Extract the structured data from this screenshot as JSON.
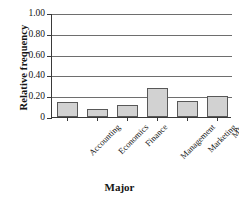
{
  "chart_data": {
    "type": "bar",
    "title": "",
    "xlabel": "Major",
    "ylabel": "Relative frequency",
    "categories": [
      "Accounting",
      "Economics",
      "Finance",
      "Management",
      "Marketing",
      "MIS"
    ],
    "values": [
      0.14,
      0.08,
      0.12,
      0.28,
      0.15,
      0.2
    ],
    "ylim": [
      0.0,
      1.0
    ],
    "yticks": [
      1.0,
      0.8,
      0.6,
      0.4,
      0.2,
      0
    ],
    "ytick_labels": [
      "1.00",
      "0.80",
      "0.60",
      "0.40",
      "0.20",
      "0"
    ],
    "grid": true,
    "grid_axis": "y",
    "legend": false,
    "bar_fill_color": "#d2d2d2",
    "bar_edge_color": "#585858",
    "axis_color": "#3a3a3a",
    "grid_color": "#6e6e6e"
  }
}
